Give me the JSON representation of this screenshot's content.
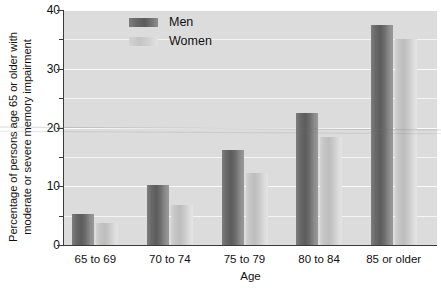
{
  "chart_data": {
    "type": "bar",
    "title": "",
    "subtitle": "",
    "xlabel": "Age",
    "ylabel": "Percentage of persons age 65 or older with moderate or severe memory impairment",
    "ylabel_lines": [
      "Percentage of persons age 65 or older with",
      "moderate or severe memory impairment"
    ],
    "categories": [
      "65 to 69",
      "70 to 74",
      "75 to 79",
      "80 to 84",
      "85 or older"
    ],
    "series": [
      {
        "name": "Men",
        "values": [
          5.2,
          10.2,
          16.2,
          22.4,
          37.4
        ],
        "color": "#666666"
      },
      {
        "name": "Women",
        "values": [
          3.8,
          6.8,
          12.2,
          18.4,
          35.0
        ],
        "color": "#cccccc"
      }
    ],
    "ylim": [
      0,
      40
    ],
    "y_major_ticks": [
      0,
      10,
      20,
      30,
      40
    ],
    "y_minor_ticks": [
      5,
      15,
      25,
      35
    ],
    "y_tick_labels": [
      "0",
      "10",
      "20",
      "30",
      "40"
    ],
    "grid": true,
    "grid_axis": "y",
    "legend_position": "top-center",
    "plot_background": "#dcdcdc",
    "gridline_color": "#f4f4f4",
    "axis_color": "#3a3a3a"
  },
  "legend": {
    "entries": [
      {
        "label": "Men"
      },
      {
        "label": "Women"
      }
    ]
  }
}
